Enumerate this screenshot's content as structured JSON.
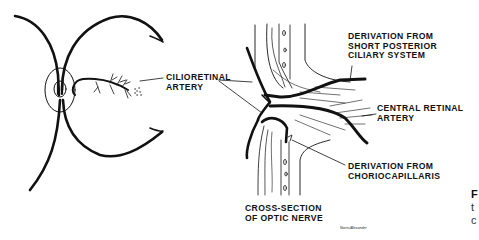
{
  "figure": {
    "left_panel": {
      "labels": {
        "cilioretinal_artery_line1": "CILIORETINAL",
        "cilioretinal_artery_line2": "ARTERY"
      }
    },
    "right_panel": {
      "labels": {
        "short_posterior_line1": "DERIVATION FROM",
        "short_posterior_line2": "SHORT POSTERIOR",
        "short_posterior_line3": "CILIARY SYSTEM",
        "central_retinal_line1": "CENTRAL RETINAL",
        "central_retinal_line2": "ARTERY",
        "choriocapillaris_line1": "DERIVATION FROM",
        "choriocapillaris_line2": "CHORIOCAPILLARIS",
        "optic_nerve_line1": "CROSS-SECTION",
        "optic_nerve_line2": "OF OPTIC NERVE"
      },
      "signature": "Norris/Alexander"
    },
    "clipped_caption": {
      "line1": "F",
      "line2": "t",
      "line3": "c"
    },
    "colors": {
      "ink": "#111111",
      "background": "#ffffff"
    }
  }
}
